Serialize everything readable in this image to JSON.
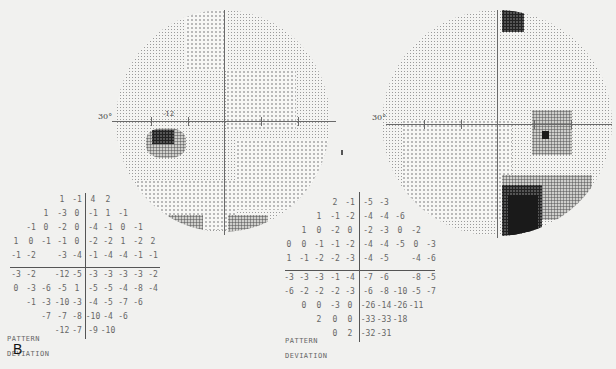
{
  "figure": {
    "panel_label": "B",
    "left_plot": {
      "axis_label": "30°",
      "marker_value": "-12"
    },
    "right_plot": {
      "axis_label": "30°"
    },
    "left_grid": {
      "caption_line1": "PATTERN",
      "caption_line2": "DEVIATION",
      "rows": [
        [
          "",
          "",
          "",
          "1",
          "-1",
          "4",
          "2",
          "",
          "",
          ""
        ],
        [
          "",
          "",
          "1",
          "-3",
          "0",
          "-1",
          "1",
          "-1",
          "",
          ""
        ],
        [
          "",
          "-1",
          "0",
          "-2",
          "0",
          "-4",
          "-1",
          "0",
          "-1",
          ""
        ],
        [
          "1",
          "0",
          "-1",
          "-1",
          "0",
          "-2",
          "-2",
          "1",
          "-2",
          "2"
        ],
        [
          "-1",
          "-2",
          "",
          "-3",
          "-4",
          "-1",
          "-4",
          "-4",
          "-1",
          "-1"
        ],
        [
          "-3",
          "-2",
          "",
          "-12",
          "-5",
          "-3",
          "-3",
          "-3",
          "-3",
          "-2"
        ],
        [
          "0",
          "-3",
          "-6",
          "-5",
          "1",
          "-5",
          "-5",
          "-4",
          "-8",
          "-4"
        ],
        [
          "",
          "-1",
          "-3",
          "-10",
          "-3",
          "-4",
          "-5",
          "-7",
          "-6",
          ""
        ],
        [
          "",
          "",
          "-7",
          "-7",
          "-8",
          "-10",
          "-4",
          "-6",
          "",
          ""
        ],
        [
          "",
          "",
          "",
          "-12",
          "-7",
          "-9",
          "-10",
          "",
          "",
          ""
        ]
      ]
    },
    "right_grid": {
      "caption_line1": "PATTERN",
      "caption_line2": "DEVIATION",
      "rows": [
        [
          "",
          "",
          "",
          "2",
          "-1",
          "-5",
          "-3",
          "",
          "",
          ""
        ],
        [
          "",
          "",
          "1",
          "-1",
          "-2",
          "-4",
          "-4",
          "-6",
          "",
          ""
        ],
        [
          "",
          "1",
          "0",
          "-2",
          "0",
          "-2",
          "-3",
          "0",
          "-2",
          ""
        ],
        [
          "0",
          "0",
          "-1",
          "-1",
          "-2",
          "-4",
          "-4",
          "-5",
          "0",
          "-3"
        ],
        [
          "1",
          "-1",
          "-2",
          "-2",
          "-3",
          "-4",
          "-5",
          "",
          "-4",
          "-6"
        ],
        [
          "-3",
          "-3",
          "-3",
          "-1",
          "-4",
          "-7",
          "-6",
          "",
          "-8",
          "-5"
        ],
        [
          "-6",
          "-2",
          "-2",
          "-2",
          "-3",
          "-6",
          "-8",
          "-10",
          "-5",
          "-7"
        ],
        [
          "",
          "0",
          "0",
          "-3",
          "0",
          "-26",
          "-14",
          "-26",
          "-11",
          ""
        ],
        [
          "",
          "",
          "2",
          "0",
          "0",
          "-33",
          "-33",
          "-18",
          "",
          ""
        ],
        [
          "",
          "",
          "",
          "0",
          "2",
          "-32",
          "-31",
          "",
          "",
          ""
        ]
      ]
    }
  }
}
